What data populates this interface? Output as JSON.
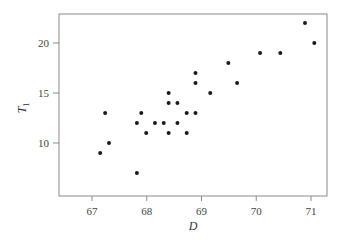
{
  "chart_data": {
    "type": "scatter",
    "title": "",
    "xlabel": "D",
    "ylabel": "T",
    "ylabel_subscript": "1",
    "xlim": [
      66.4,
      71.3
    ],
    "ylim": [
      5.7,
      22.9
    ],
    "x_ticks": [
      67,
      68,
      69,
      70,
      71
    ],
    "y_ticks": [
      10,
      15,
      20
    ],
    "grid": false,
    "legend": null,
    "points": [
      {
        "x": 67.15,
        "y": 9
      },
      {
        "x": 67.24,
        "y": 13
      },
      {
        "x": 67.31,
        "y": 10
      },
      {
        "x": 67.82,
        "y": 7
      },
      {
        "x": 67.82,
        "y": 12
      },
      {
        "x": 67.9,
        "y": 13
      },
      {
        "x": 67.99,
        "y": 11
      },
      {
        "x": 68.15,
        "y": 12
      },
      {
        "x": 68.31,
        "y": 12
      },
      {
        "x": 68.4,
        "y": 15
      },
      {
        "x": 68.4,
        "y": 14
      },
      {
        "x": 68.4,
        "y": 11
      },
      {
        "x": 68.56,
        "y": 14
      },
      {
        "x": 68.56,
        "y": 12
      },
      {
        "x": 68.73,
        "y": 13
      },
      {
        "x": 68.73,
        "y": 11
      },
      {
        "x": 68.89,
        "y": 13
      },
      {
        "x": 68.89,
        "y": 16
      },
      {
        "x": 68.89,
        "y": 17
      },
      {
        "x": 69.16,
        "y": 15
      },
      {
        "x": 69.49,
        "y": 18
      },
      {
        "x": 69.65,
        "y": 16
      },
      {
        "x": 70.07,
        "y": 19
      },
      {
        "x": 70.44,
        "y": 19
      },
      {
        "x": 70.89,
        "y": 22
      },
      {
        "x": 71.06,
        "y": 20
      }
    ],
    "colors": {
      "axis": "#8a8a8a",
      "point": "#1a1a1a",
      "text": "#444444"
    }
  }
}
